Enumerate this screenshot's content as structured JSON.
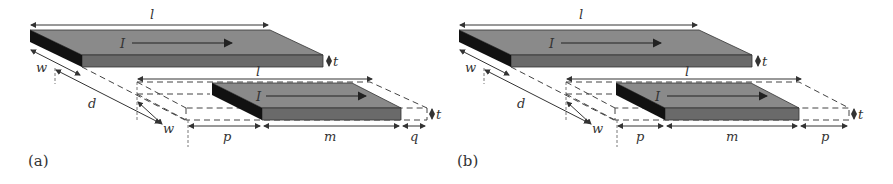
{
  "figure": {
    "panels": [
      {
        "id": "a",
        "caption": "(a)",
        "labels": {
          "top_length": "l",
          "top_current": "I",
          "top_thickness": "t",
          "width_top": "w",
          "separation": "d",
          "width_bottom": "w",
          "bottom_length": "l",
          "bottom_current": "I",
          "bottom_thickness": "t",
          "offset_left": "p",
          "overlap": "m",
          "offset_right": "q"
        }
      },
      {
        "id": "b",
        "caption": "(b)",
        "labels": {
          "top_length": "l",
          "top_current": "I",
          "top_thickness": "t",
          "width_top": "w",
          "separation": "d",
          "width_bottom": "w",
          "bottom_length": "l",
          "bottom_current": "I",
          "bottom_thickness": "t",
          "offset_left": "p",
          "overlap": "m",
          "offset_right": "p"
        }
      }
    ],
    "colors": {
      "top_face": "#8a8a8a",
      "front_face": "#6a6a6a",
      "side_face": "#111111",
      "lines": "#333333"
    }
  }
}
